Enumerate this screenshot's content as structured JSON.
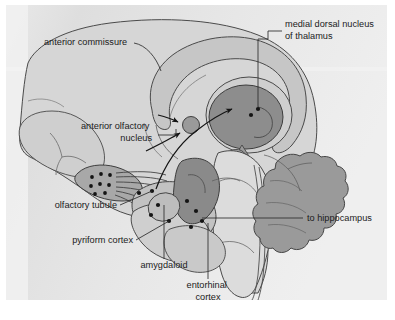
{
  "figure": {
    "background_color": "#eeeeee",
    "outer_color": "#ffffff",
    "line_color": "#3a3a3a",
    "palette": {
      "light_tissue": "#d2d2d2",
      "mid_tissue": "#bdbdbd",
      "dark_tissue": "#8d8d8d",
      "darker_tissue": "#7e7e7e",
      "pale_tissue": "#e4e4e4",
      "neuron_dot": "#1a1a1a"
    },
    "labels": [
      {
        "id": "anterior-commissure",
        "text": "anterior commissure",
        "lines": [
          "anterior commissure"
        ],
        "x": 38,
        "y": 40,
        "anchor": "start"
      },
      {
        "id": "medial-dorsal-nucleus-of-thalamus",
        "text": "medial dorsal nucleus of thalamus",
        "lines": [
          "medial dorsal nucleus",
          "of thalamus"
        ],
        "x": 279,
        "y": 22,
        "anchor": "start"
      },
      {
        "id": "anterior-olfactory-nucleus",
        "text": "anterior olfactory nucleus",
        "lines": [
          "anterior olfactory",
          "nucleus"
        ],
        "x": 146,
        "y": 124,
        "anchor": "end"
      },
      {
        "id": "olfactory-tubule",
        "text": "olfactory tubule",
        "lines": [
          "olfactory tubule"
        ],
        "x": 111,
        "y": 203,
        "anchor": "end"
      },
      {
        "id": "pyriform-cortex",
        "text": "pyriform cortex",
        "lines": [
          "pyriform cortex"
        ],
        "x": 127,
        "y": 238,
        "anchor": "end"
      },
      {
        "id": "amygdaloid",
        "text": "amygdaloid",
        "lines": [
          "amygdaloid"
        ],
        "x": 158,
        "y": 263,
        "anchor": "middle"
      },
      {
        "id": "entorhinal-cortex",
        "text": "entorhinal cortex",
        "lines": [
          "entorhinal",
          "cortex"
        ],
        "x": 202,
        "y": 283,
        "anchor": "middle"
      },
      {
        "id": "to-hippocampus",
        "text": "to hippocampus",
        "lines": [
          "to hippocampus"
        ],
        "x": 301,
        "y": 216,
        "anchor": "start"
      }
    ]
  }
}
